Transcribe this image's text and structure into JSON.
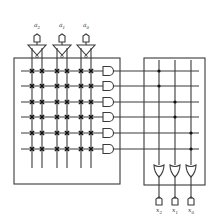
{
  "diagram": {
    "colors": {
      "line": "#3a3a3a",
      "background": "#ffffff",
      "dot": "#111111"
    },
    "inputs": [
      {
        "label": "a",
        "sub": "2",
        "x": 37
      },
      {
        "label": "a",
        "sub": "1",
        "x": 62
      },
      {
        "label": "a",
        "sub": "0",
        "x": 86
      }
    ],
    "outputs": [
      {
        "label": "x",
        "sub": "2",
        "x": 159
      },
      {
        "label": "x",
        "sub": "1",
        "x": 175
      },
      {
        "label": "x",
        "sub": "0",
        "x": 191
      }
    ],
    "and_plane": {
      "box": {
        "x": 14,
        "y": 58,
        "w": 106,
        "h": 126
      },
      "columns": [
        32,
        42,
        57,
        67,
        81,
        91
      ],
      "rows": [
        71,
        86,
        102,
        117,
        133,
        149
      ],
      "crosspoints": "all",
      "gate_x": 103
    },
    "or_plane": {
      "box": {
        "x": 144,
        "y": 58,
        "w": 61,
        "h": 127
      },
      "columns": [
        159,
        175,
        191
      ],
      "connections": [
        {
          "row": 0,
          "col": 0
        },
        {
          "row": 1,
          "col": 0
        },
        {
          "row": 2,
          "col": 1
        },
        {
          "row": 3,
          "col": 1
        },
        {
          "row": 4,
          "col": 2
        },
        {
          "row": 5,
          "col": 2
        }
      ],
      "gate_y": 165
    }
  }
}
